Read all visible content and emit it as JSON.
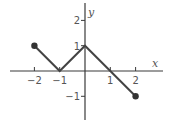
{
  "chart_data": {
    "type": "line",
    "title": "",
    "xlabel": "x",
    "ylabel": "y",
    "xlim": [
      -3,
      3
    ],
    "ylim": [
      -2,
      2.7
    ],
    "grid": false,
    "x_ticks": [
      -2,
      -1,
      1,
      2
    ],
    "x_tick_labels": [
      "−2",
      "−1",
      "1",
      "2"
    ],
    "y_ticks": [
      2,
      1,
      -1
    ],
    "y_tick_labels": [
      "2",
      "1",
      "−1"
    ],
    "series": [
      {
        "name": "piecewise",
        "points": [
          [
            -2,
            1
          ],
          [
            -1,
            0
          ],
          [
            0,
            1
          ],
          [
            2,
            -1
          ]
        ],
        "endpoints_closed": [
          [
            -2,
            1
          ],
          [
            2,
            -1
          ]
        ]
      }
    ]
  }
}
